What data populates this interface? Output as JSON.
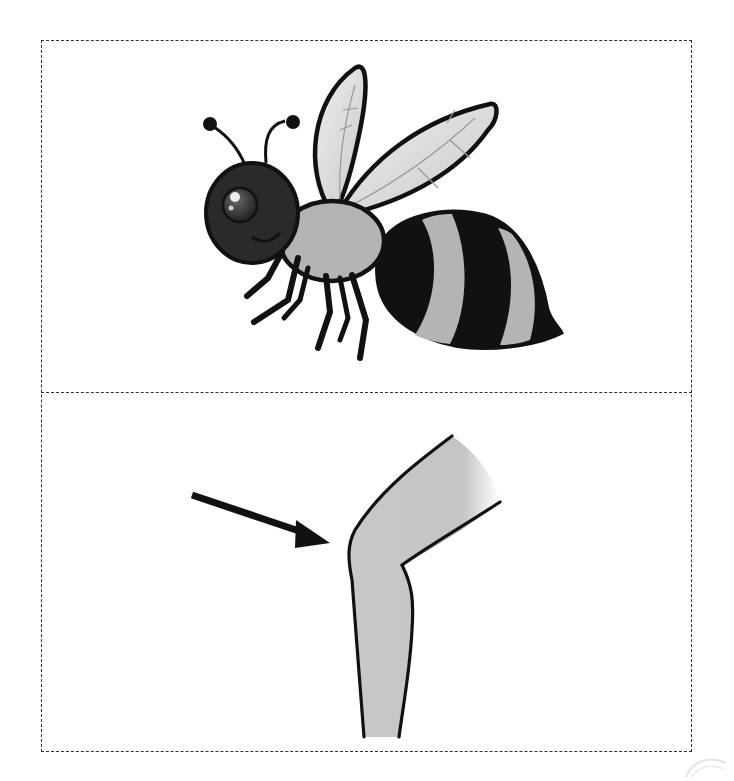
{
  "figure": {
    "layout": "two-panel dashed card",
    "panels": [
      {
        "id": "top",
        "subject": "bee",
        "description": "Cartoon bee with dark head, smiling, two antennae, two translucent wings, gray thorax, six black legs, black-and-gray striped abdomen with stinger"
      },
      {
        "id": "bottom",
        "subject": "knee",
        "description": "Bent leg at the knee with a black arrow pointing to the front of the knee"
      }
    ],
    "colors": {
      "border": "#333333",
      "outline": "#111111",
      "body_gray": "#b4b4b4",
      "head_dark": "#2a2a2a",
      "wing_fill": "#d8d8d8",
      "skin_gray": "#c8c8c8",
      "background": "#ffffff"
    }
  }
}
